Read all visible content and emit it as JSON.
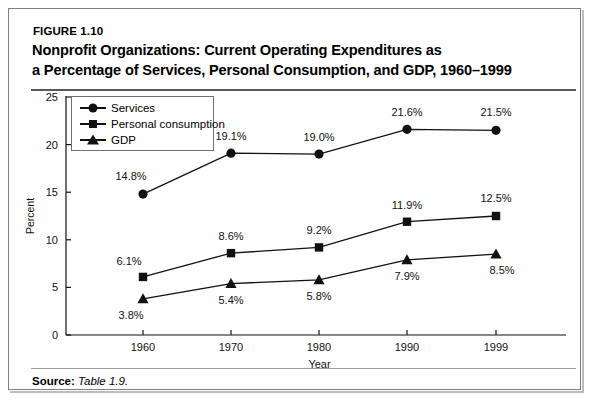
{
  "figure": {
    "number_label": "FIGURE 1.10",
    "title": "Nonprofit Organizations: Current Operating Expenditures as a Percentage of Services, Personal Consumption, and GDP, 1960–1999",
    "title_line1": "Nonprofit Organizations: Current Operating Expenditures as",
    "title_line2": "a Percentage of Services, Personal Consumption, and GDP, 1960–1999"
  },
  "source": {
    "label": "Source:",
    "value": "Table 1.9."
  },
  "chart_data": {
    "type": "line",
    "title": "Nonprofit Organizations: Current Operating Expenditures as a Percentage of Services, Personal Consumption, and GDP, 1960–1999",
    "xlabel": "Year",
    "ylabel": "Percent",
    "categories": [
      "1960",
      "1970",
      "1980",
      "1990",
      "1999"
    ],
    "ylim": [
      0,
      25
    ],
    "yticks": [
      0,
      5,
      10,
      15,
      20,
      25
    ],
    "ytick_labels": [
      "0",
      "5",
      "10",
      "15",
      "20",
      "25"
    ],
    "grid": false,
    "legend_position": "upper-left-inside",
    "series": [
      {
        "name": "Services",
        "marker": "circle",
        "values": [
          14.8,
          19.1,
          19.0,
          21.6,
          21.5
        ],
        "labels": [
          "14.8%",
          "19.1%",
          "19.0%",
          "21.6%",
          "21.5%"
        ]
      },
      {
        "name": "Personal consumption",
        "marker": "square",
        "values": [
          6.1,
          8.6,
          9.2,
          11.9,
          12.5
        ],
        "labels": [
          "6.1%",
          "8.6%",
          "9.2%",
          "11.9%",
          "12.5%"
        ]
      },
      {
        "name": "GDP",
        "marker": "triangle",
        "values": [
          3.8,
          5.4,
          5.8,
          7.9,
          8.5
        ],
        "labels": [
          "3.8%",
          "5.4%",
          "5.8%",
          "7.9%",
          "8.5%"
        ]
      }
    ]
  },
  "colors": {
    "ink": "#111111",
    "frame": "#7c7f83",
    "divider": "#55585c",
    "background": "#ffffff"
  }
}
